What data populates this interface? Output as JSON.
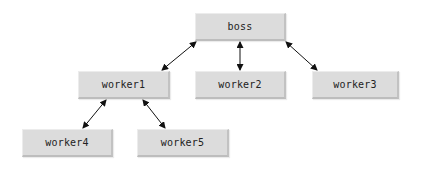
{
  "diagram": {
    "type": "hierarchy-tree",
    "nodes": [
      {
        "id": "boss",
        "label": "boss",
        "x": 195,
        "y": 13,
        "w": 91,
        "h": 28
      },
      {
        "id": "worker1",
        "label": "worker1",
        "x": 78,
        "y": 71,
        "w": 92,
        "h": 28
      },
      {
        "id": "worker2",
        "label": "worker2",
        "x": 195,
        "y": 71,
        "w": 91,
        "h": 28
      },
      {
        "id": "worker3",
        "label": "worker3",
        "x": 312,
        "y": 71,
        "w": 87,
        "h": 28
      },
      {
        "id": "worker4",
        "label": "worker4",
        "x": 22,
        "y": 129,
        "w": 91,
        "h": 28
      },
      {
        "id": "worker5",
        "label": "worker5",
        "x": 137,
        "y": 129,
        "w": 92,
        "h": 28
      }
    ],
    "edges": [
      {
        "from": "boss",
        "to": "worker1",
        "arrows": "both"
      },
      {
        "from": "boss",
        "to": "worker2",
        "arrows": "both"
      },
      {
        "from": "boss",
        "to": "worker3",
        "arrows": "both"
      },
      {
        "from": "worker1",
        "to": "worker4",
        "arrows": "both"
      },
      {
        "from": "worker1",
        "to": "worker5",
        "arrows": "both"
      }
    ]
  },
  "colors": {
    "node_fill": "#dcdcdc",
    "node_text": "#222222",
    "edge": "#111111",
    "background": "#ffffff"
  }
}
